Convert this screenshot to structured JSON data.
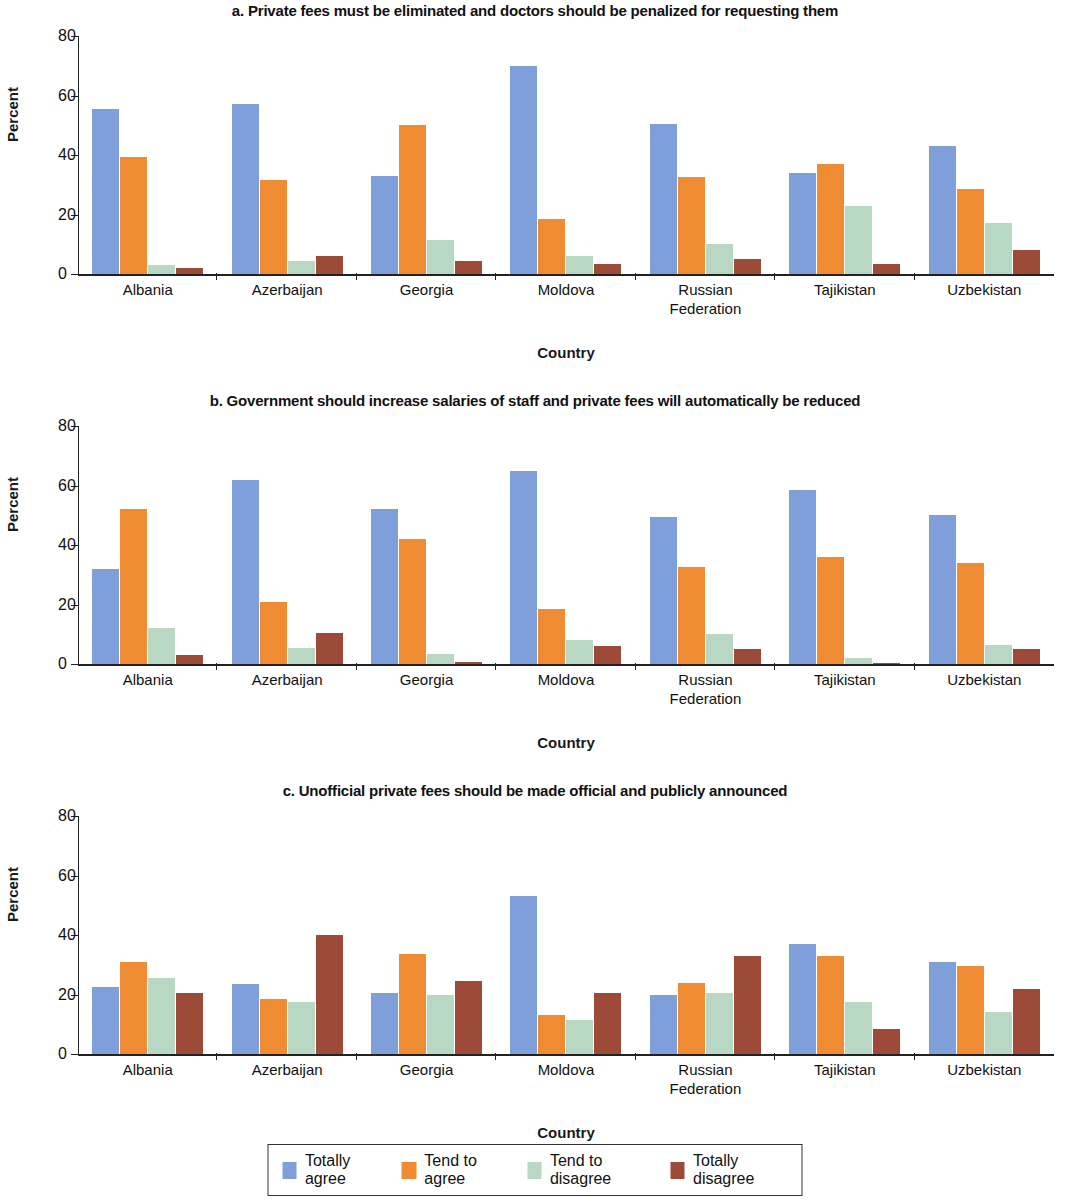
{
  "figure": {
    "ylabel": "Percent",
    "xlabel": "Country",
    "ylim": [
      0,
      80
    ],
    "yticks": [
      "0",
      "20",
      "40",
      "60",
      "80"
    ],
    "countries": [
      "Albania",
      "Azerbaijan",
      "Georgia",
      "Moldova",
      "Russian Federation",
      "Tajikistan",
      "Uzbekistan"
    ],
    "country_lines": [
      [
        "Albania"
      ],
      [
        "Azerbaijan"
      ],
      [
        "Georgia"
      ],
      [
        "Moldova"
      ],
      [
        "Russian",
        "Federation"
      ],
      [
        "Tajikistan"
      ],
      [
        "Uzbekistan"
      ]
    ]
  },
  "legend": {
    "items": [
      {
        "label": "Totally agree",
        "color": "#7f9fdb"
      },
      {
        "label": "Tend to agree",
        "color": "#ef8b33"
      },
      {
        "label": "Tend to disagree",
        "color": "#b9d8c4"
      },
      {
        "label": "Totally disagree",
        "color": "#9d4a38"
      }
    ]
  },
  "panels": [
    {
      "id": "a",
      "title": "a. Private fees must be eliminated and doctors should be penalized for requesting them"
    },
    {
      "id": "b",
      "title": "b. Government should increase salaries of staff and private fees will automatically be reduced"
    },
    {
      "id": "c",
      "title": "c. Unofficial private fees should be made official and publicly announced"
    }
  ],
  "chart_data": [
    {
      "type": "bar",
      "title": "a. Private fees must be eliminated and doctors should be penalized for requesting them",
      "xlabel": "Country",
      "ylabel": "Percent",
      "ylim": [
        0,
        80
      ],
      "yticks": [
        0,
        20,
        40,
        60,
        80
      ],
      "grid": false,
      "legend_position": "bottom",
      "categories": [
        "Albania",
        "Azerbaijan",
        "Georgia",
        "Moldova",
        "Russian Federation",
        "Tajikistan",
        "Uzbekistan"
      ],
      "series": [
        {
          "name": "Totally agree",
          "color": "#7f9fdb",
          "values": [
            55.5,
            57,
            33,
            70,
            50.5,
            34,
            43
          ]
        },
        {
          "name": "Tend to agree",
          "color": "#ef8b33",
          "values": [
            39.5,
            31.5,
            50,
            18.5,
            32.5,
            37,
            28.5
          ]
        },
        {
          "name": "Tend to disagree",
          "color": "#b9d8c4",
          "values": [
            3,
            4.5,
            11.5,
            6,
            10,
            23,
            17
          ]
        },
        {
          "name": "Totally disagree",
          "color": "#9d4a38",
          "values": [
            2,
            6,
            4.5,
            3.5,
            5,
            3.5,
            8
          ]
        }
      ]
    },
    {
      "type": "bar",
      "title": "b. Government should increase salaries of staff and private fees will automatically be reduced",
      "xlabel": "Country",
      "ylabel": "Percent",
      "ylim": [
        0,
        80
      ],
      "yticks": [
        0,
        20,
        40,
        60,
        80
      ],
      "grid": false,
      "legend_position": "bottom",
      "categories": [
        "Albania",
        "Azerbaijan",
        "Georgia",
        "Moldova",
        "Russian Federation",
        "Tajikistan",
        "Uzbekistan"
      ],
      "series": [
        {
          "name": "Totally agree",
          "color": "#7f9fdb",
          "values": [
            32,
            62,
            52,
            65,
            49.5,
            58.5,
            50
          ]
        },
        {
          "name": "Tend to agree",
          "color": "#ef8b33",
          "values": [
            52,
            21,
            42,
            18.5,
            32.5,
            36,
            34
          ]
        },
        {
          "name": "Tend to disagree",
          "color": "#b9d8c4",
          "values": [
            12,
            5.5,
            3.5,
            8,
            10,
            2,
            6.5
          ]
        },
        {
          "name": "Totally disagree",
          "color": "#9d4a38",
          "values": [
            3,
            10.5,
            0.7,
            6,
            5,
            0.5,
            5
          ]
        }
      ]
    },
    {
      "type": "bar",
      "title": "c. Unofficial private fees should be made official and publicly announced",
      "xlabel": "Country",
      "ylabel": "Percent",
      "ylim": [
        0,
        80
      ],
      "yticks": [
        0,
        20,
        40,
        60,
        80
      ],
      "grid": false,
      "legend_position": "bottom",
      "categories": [
        "Albania",
        "Azerbaijan",
        "Georgia",
        "Moldova",
        "Russian Federation",
        "Tajikistan",
        "Uzbekistan"
      ],
      "series": [
        {
          "name": "Totally agree",
          "color": "#7f9fdb",
          "values": [
            22.5,
            23.5,
            20.5,
            53,
            20,
            37,
            31
          ]
        },
        {
          "name": "Tend to agree",
          "color": "#ef8b33",
          "values": [
            31,
            18.5,
            33.5,
            13,
            24,
            33,
            29.5
          ]
        },
        {
          "name": "Tend to disagree",
          "color": "#b9d8c4",
          "values": [
            25.5,
            17.5,
            20,
            11.5,
            20.5,
            17.5,
            14
          ]
        },
        {
          "name": "Totally disagree",
          "color": "#9d4a38",
          "values": [
            20.5,
            40,
            24.5,
            20.5,
            33,
            8.5,
            22
          ]
        }
      ]
    }
  ]
}
